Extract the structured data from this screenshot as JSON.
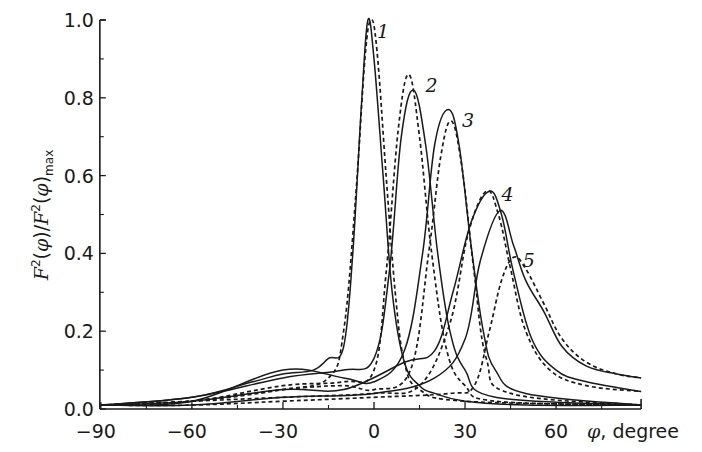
{
  "chart_data": {
    "type": "line",
    "title": "",
    "xlabel": "φ, degree",
    "ylabel": "F²(φ)/F²(φ)max",
    "xlim": [
      -90,
      88
    ],
    "ylim": [
      0,
      1.0
    ],
    "x_ticks": [
      -90,
      -60,
      -30,
      0,
      30,
      60
    ],
    "x_tick_labels": [
      "−90",
      "−60",
      "−30",
      "0",
      "30",
      "60"
    ],
    "x_minor_ticks": [
      -75,
      -45,
      -15,
      15,
      45,
      75
    ],
    "y_ticks": [
      0.0,
      0.2,
      0.4,
      0.6,
      0.8,
      1.0
    ],
    "y_tick_labels": [
      "0.0",
      "0.2",
      "0.4",
      "0.6",
      "0.8",
      "1.0"
    ],
    "y_minor_ticks": [
      0.1,
      0.3,
      0.5,
      0.7,
      0.9
    ],
    "grid": false,
    "legend": "none (curves numbered 1–5 inline; solid = one case, dashed = comparison case)",
    "series": [
      {
        "name": "1 (solid)",
        "curve": 1,
        "style": "solid",
        "x": [
          -90,
          -60,
          -40,
          -30,
          -20,
          -15,
          -10,
          -7,
          -4,
          -2,
          0,
          3,
          6,
          10,
          15,
          20,
          30,
          50,
          88
        ],
        "y": [
          0.01,
          0.03,
          0.07,
          0.09,
          0.1,
          0.13,
          0.16,
          0.4,
          0.8,
          1.0,
          0.9,
          0.6,
          0.3,
          0.12,
          0.06,
          0.04,
          0.02,
          0.01,
          0.01
        ]
      },
      {
        "name": "1 (dashed)",
        "curve": 1,
        "style": "dashed",
        "x": [
          -90,
          -60,
          -30,
          -15,
          -10,
          -6,
          -3,
          -1,
          1,
          4,
          7,
          10,
          15,
          30,
          88
        ],
        "y": [
          0.01,
          0.02,
          0.05,
          0.08,
          0.2,
          0.55,
          0.9,
          1.0,
          0.92,
          0.6,
          0.3,
          0.12,
          0.05,
          0.02,
          0.01
        ]
      },
      {
        "name": "2 (solid)",
        "curve": 2,
        "style": "solid",
        "x": [
          -90,
          -60,
          -30,
          -10,
          0,
          5,
          9,
          13,
          17,
          21,
          25,
          30,
          40,
          88
        ],
        "y": [
          0.01,
          0.03,
          0.08,
          0.1,
          0.13,
          0.35,
          0.7,
          0.82,
          0.68,
          0.4,
          0.2,
          0.1,
          0.03,
          0.01
        ]
      },
      {
        "name": "2 (dashed)",
        "curve": 2,
        "style": "dashed",
        "x": [
          -90,
          -60,
          -30,
          -10,
          0,
          4,
          8,
          11.5,
          15,
          19,
          24,
          30,
          40,
          88
        ],
        "y": [
          0.01,
          0.02,
          0.06,
          0.07,
          0.1,
          0.35,
          0.72,
          0.86,
          0.7,
          0.4,
          0.15,
          0.06,
          0.02,
          0.01
        ]
      },
      {
        "name": "3 (solid)",
        "curve": 3,
        "style": "solid",
        "x": [
          -90,
          -60,
          -30,
          -10,
          0,
          10,
          16,
          20,
          24.5,
          28,
          32,
          36,
          40,
          50,
          88
        ],
        "y": [
          0.01,
          0.02,
          0.1,
          0.08,
          0.07,
          0.15,
          0.4,
          0.68,
          0.77,
          0.68,
          0.42,
          0.2,
          0.1,
          0.04,
          0.01
        ]
      },
      {
        "name": "3 (dashed)",
        "curve": 3,
        "style": "dashed",
        "x": [
          -90,
          -60,
          -30,
          -10,
          0,
          12,
          18,
          22,
          25.5,
          29,
          33,
          37,
          45,
          88
        ],
        "y": [
          0.01,
          0.02,
          0.05,
          0.06,
          0.05,
          0.1,
          0.4,
          0.65,
          0.74,
          0.62,
          0.35,
          0.13,
          0.04,
          0.01
        ]
      },
      {
        "name": "4 (solid)",
        "curve": 4,
        "style": "solid",
        "x": [
          -90,
          -60,
          -30,
          -10,
          10,
          20,
          26,
          32,
          38,
          42,
          46,
          52,
          60,
          70,
          88
        ],
        "y": [
          0.01,
          0.02,
          0.05,
          0.05,
          0.12,
          0.15,
          0.3,
          0.48,
          0.56,
          0.5,
          0.35,
          0.18,
          0.1,
          0.07,
          0.045
        ]
      },
      {
        "name": "4 (dashed)",
        "curve": 4,
        "style": "dashed",
        "x": [
          -90,
          -60,
          -30,
          0,
          15,
          25,
          31,
          37,
          41,
          45,
          50,
          58,
          70,
          88
        ],
        "y": [
          0.01,
          0.02,
          0.03,
          0.04,
          0.06,
          0.22,
          0.45,
          0.56,
          0.5,
          0.36,
          0.2,
          0.1,
          0.06,
          0.045
        ]
      },
      {
        "name": "5 (solid)",
        "curve": 5,
        "style": "solid",
        "x": [
          -90,
          -60,
          -30,
          0,
          20,
          30,
          35,
          41.5,
          46,
          50,
          56,
          62,
          70,
          80,
          88
        ],
        "y": [
          0.01,
          0.01,
          0.03,
          0.04,
          0.08,
          0.18,
          0.38,
          0.51,
          0.42,
          0.33,
          0.25,
          0.16,
          0.11,
          0.09,
          0.08
        ]
      },
      {
        "name": "5 (dashed)",
        "curve": 5,
        "style": "dashed",
        "x": [
          -90,
          -60,
          -30,
          0,
          25,
          33,
          38,
          42,
          46,
          50,
          56,
          62,
          70,
          80,
          88
        ],
        "y": [
          0.01,
          0.01,
          0.02,
          0.03,
          0.04,
          0.06,
          0.2,
          0.33,
          0.39,
          0.36,
          0.27,
          0.18,
          0.12,
          0.09,
          0.08
        ]
      }
    ],
    "annotations": [
      {
        "text": "1",
        "x": 1,
        "y": 0.97
      },
      {
        "text": "2",
        "x": 17,
        "y": 0.83
      },
      {
        "text": "3",
        "x": 29,
        "y": 0.74
      },
      {
        "text": "4",
        "x": 42,
        "y": 0.55
      },
      {
        "text": "5",
        "x": 49,
        "y": 0.38
      }
    ]
  },
  "labels": {
    "x_axis_title": "φ, degree",
    "y_axis_title_main": "F",
    "y_axis_title_full": "F²(φ)/F²(φ)max",
    "y_axis_sub": "max"
  },
  "colors": {
    "ink": "#1a1a1a",
    "background": "#ffffff"
  }
}
